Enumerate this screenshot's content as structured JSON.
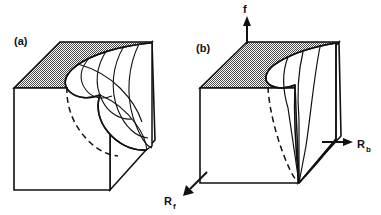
{
  "figure": {
    "width": 381,
    "height": 215,
    "background": "#ffffff",
    "ink": "#111111",
    "shade_fill": "url(#stipple)",
    "shade_description": "50% checkerboard dither stipple",
    "type": "line-diagram"
  },
  "panels": [
    {
      "id": "a",
      "label": "(a)",
      "label_x": 14,
      "label_y": 45,
      "description": "three-quarter view of pleated cusp surface inside an open box",
      "box": {
        "front_face": "14,88 110,88 110,190 14,190",
        "top_face": "14,88 60,42 152,42 110,88",
        "right_face": "110,88 152,42 155,140 110,190",
        "top_face_shaded": true
      },
      "surface": {
        "fold_curves": 5,
        "cusp_point_x": 60,
        "cusp_point_y": 70,
        "has_hidden_dashed_edge": true
      }
    },
    {
      "id": "b",
      "label": "(b)",
      "label_x": 196,
      "label_y": 52,
      "description": "edge-on view of the same surface; the fold collapses to converging lines",
      "box": {
        "front_face": "200,88 298,88 298,183 200,183",
        "top_face": "200,88 247,42 339,42 298,88",
        "right_face": "298,88 339,42 341,136 298,183",
        "top_face_shaded": true
      },
      "surface": {
        "fold_curves": 4,
        "convergence_point_x": 299,
        "convergence_point_y": 183,
        "has_hidden_dashed_edge": true
      }
    }
  ],
  "axes": [
    {
      "name": "f",
      "label": "f",
      "subscript": "",
      "label_x": 245,
      "label_y": 12,
      "direction": "up",
      "arrow_tip": "247,18",
      "arrow_tail": "247,44"
    },
    {
      "name": "Rb",
      "label": "R",
      "subscript": "b",
      "label_x": 357,
      "label_y": 148,
      "direction": "right",
      "arrow_tip": "353,142",
      "arrow_tail": "323,142"
    },
    {
      "name": "Rf",
      "label": "R",
      "subscript": "f",
      "label_x": 168,
      "label_y": 205,
      "direction": "down-left",
      "arrow_tip": "183,195",
      "arrow_tail": "207,172"
    }
  ]
}
